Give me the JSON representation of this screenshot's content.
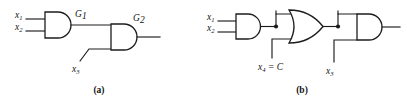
{
  "figure": {
    "stroke_color": "#1c1c1c",
    "background_color": "#ffffff",
    "panels": [
      {
        "id": "panel-a",
        "caption": "(a)",
        "gates": [
          {
            "name": "G1",
            "label_main": "G",
            "label_sub": "1",
            "type": "AND",
            "inputs": [
              "x1",
              "x2"
            ]
          },
          {
            "name": "G2",
            "label_main": "G",
            "label_sub": "2",
            "type": "AND",
            "inputs": [
              "G1",
              "x3"
            ]
          }
        ],
        "inputs": [
          {
            "name": "x1",
            "label_main": "x",
            "label_sub": "1"
          },
          {
            "name": "x2",
            "label_main": "x",
            "label_sub": "2"
          },
          {
            "name": "x3",
            "label_main": "x",
            "label_sub": "3"
          }
        ]
      },
      {
        "id": "panel-b",
        "caption": "(b)",
        "gates": [
          {
            "name": "and1",
            "type": "AND",
            "inputs": [
              "x1",
              "x2"
            ]
          },
          {
            "name": "or1",
            "type": "OR",
            "inputs": [
              "and1",
              "x4"
            ]
          },
          {
            "name": "and2",
            "type": "AND",
            "inputs": [
              "or1",
              "x3"
            ]
          }
        ],
        "inputs": [
          {
            "name": "x1",
            "label_main": "x",
            "label_sub": "1"
          },
          {
            "name": "x2",
            "label_main": "x",
            "label_sub": "2"
          },
          {
            "name": "x4",
            "label_main": "x",
            "label_sub": "4",
            "label_suffix": " = C",
            "equals_value": "C"
          },
          {
            "name": "x3",
            "label_main": "x",
            "label_sub": "3"
          }
        ]
      }
    ]
  }
}
